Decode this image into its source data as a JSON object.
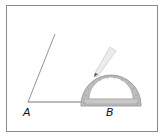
{
  "diagram": {
    "type": "angle-construction-with-protractor",
    "points": {
      "A": {
        "label": "A",
        "x": 28,
        "y": 102
      },
      "B": {
        "label": "B",
        "x": 111,
        "y": 102
      }
    },
    "rays": [
      {
        "name": "ray-AB",
        "from": "A",
        "to": [
          115,
          102
        ]
      },
      {
        "name": "ray-A-upper",
        "from": "A",
        "to": [
          55,
          34
        ]
      }
    ],
    "protractor": {
      "center_x": 111,
      "center_y": 104,
      "outer_radius": 30,
      "inner_radius": 18,
      "color": "#9a9a9a"
    },
    "pencil": {
      "tip": [
        94,
        77
      ],
      "end": [
        113,
        49
      ]
    },
    "colors": {
      "frame": "#8a8a8a",
      "line": "#555555",
      "protractor_fill": "#b8b8b8",
      "pencil": "#e6e6e6"
    }
  }
}
